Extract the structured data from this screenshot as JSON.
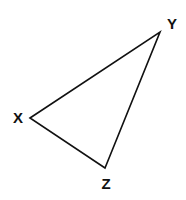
{
  "diagram": {
    "type": "triangle",
    "stroke_color": "#111111",
    "vertices": [
      {
        "name": "X",
        "x": 30,
        "y": 118,
        "label_x": 18,
        "label_y": 123
      },
      {
        "name": "Y",
        "x": 160,
        "y": 32,
        "label_x": 172,
        "label_y": 28
      },
      {
        "name": "Z",
        "x": 105,
        "y": 168,
        "label_x": 106,
        "label_y": 189
      }
    ],
    "labels": {
      "x": "X",
      "y": "Y",
      "z": "Z"
    }
  }
}
